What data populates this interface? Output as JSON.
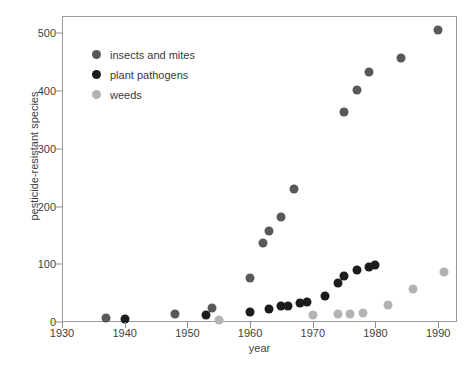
{
  "chart_data": {
    "type": "scatter",
    "title": "",
    "xlabel": "year",
    "ylabel": "pesticide-resistant species",
    "xlim": [
      1930,
      1993
    ],
    "ylim": [
      0,
      530
    ],
    "xticks": [
      1930,
      1940,
      1950,
      1960,
      1970,
      1980,
      1990
    ],
    "yticks": [
      0,
      100,
      200,
      300,
      400,
      500
    ],
    "grid": false,
    "legend_position": "upper-left-inside",
    "series": [
      {
        "name": "insects and mites",
        "color": "#595959",
        "points": [
          [
            1937,
            7
          ],
          [
            1948,
            14
          ],
          [
            1954,
            25
          ],
          [
            1960,
            76
          ],
          [
            1962,
            137
          ],
          [
            1963,
            157
          ],
          [
            1965,
            182
          ],
          [
            1967,
            230
          ],
          [
            1975,
            364
          ],
          [
            1977,
            401
          ],
          [
            1979,
            433
          ],
          [
            1984,
            458
          ],
          [
            1990,
            505
          ]
        ]
      },
      {
        "name": "plant pathogens",
        "color": "#1c1c1c",
        "points": [
          [
            1940,
            5
          ],
          [
            1953,
            12
          ],
          [
            1960,
            18
          ],
          [
            1963,
            22
          ],
          [
            1965,
            27
          ],
          [
            1966,
            28
          ],
          [
            1968,
            33
          ],
          [
            1969,
            34
          ],
          [
            1972,
            45
          ],
          [
            1974,
            68
          ],
          [
            1975,
            79
          ],
          [
            1977,
            90
          ],
          [
            1979,
            96
          ],
          [
            1980,
            99
          ]
        ]
      },
      {
        "name": "weeds",
        "color": "#b3b3b3",
        "points": [
          [
            1955,
            3
          ],
          [
            1970,
            12
          ],
          [
            1974,
            13
          ],
          [
            1976,
            14
          ],
          [
            1978,
            15
          ],
          [
            1982,
            30
          ],
          [
            1986,
            57
          ],
          [
            1991,
            86
          ]
        ]
      }
    ]
  },
  "caption": {
    "text": ""
  }
}
